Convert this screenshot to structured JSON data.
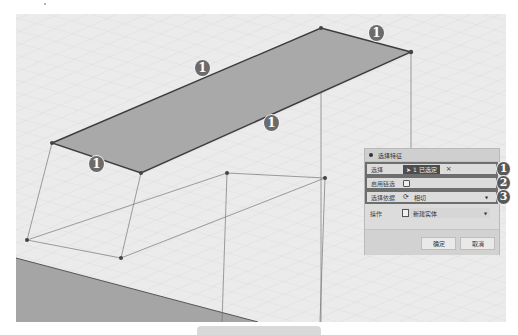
{
  "dialog": {
    "title": "选择特征",
    "rows": [
      {
        "label": "选择",
        "button_label": "1 已选定",
        "clear_icon": "×",
        "badge": "1"
      },
      {
        "label": "启用链选",
        "checked": false,
        "badge": "2"
      },
      {
        "label": "选择依据",
        "value": "相切",
        "icon": "tangent-chain-icon",
        "badge": "3"
      },
      {
        "label": "操作",
        "value": "新建实体",
        "icon": "new-body-icon"
      }
    ],
    "ok_label": "确定",
    "cancel_label": "取消"
  },
  "viewport": {
    "edge_callouts": [
      "1",
      "1",
      "1",
      "1"
    ],
    "colors": {
      "grid_background": "#e9e9e9",
      "selected_face": "#a8a8a8",
      "edge": "#444444",
      "ground_plane": "#a5a5a5"
    }
  }
}
